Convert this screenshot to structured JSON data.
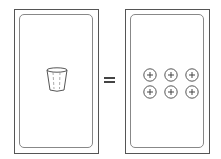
{
  "diagram": {
    "left_card": {
      "content": "cup-icon",
      "label": "cup"
    },
    "operator": "=",
    "right_card": {
      "content": "coin-grid",
      "rows": 2,
      "cols": 3,
      "count": 6,
      "item_icon": "circled-plus-icon"
    }
  },
  "colors": {
    "stroke": "#555555",
    "inner": "#888888",
    "background": "#ffffff"
  }
}
